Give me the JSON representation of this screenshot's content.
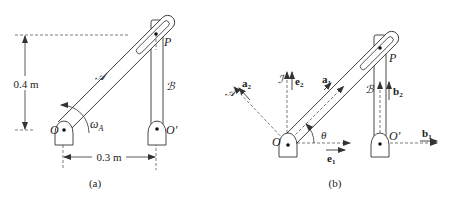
{
  "figure_a": {
    "caption": "(a)",
    "labels": {
      "height_dim": "0.4 m",
      "width_dim": "0.3 m",
      "pivot_o": "O",
      "pivot_o_prime": "O′",
      "point_p": "P",
      "arm_a": "𝒜",
      "bar_b": "ℬ",
      "omega": "ω",
      "omega_sub": "A"
    }
  },
  "figure_b": {
    "caption": "(b)",
    "labels": {
      "pivot_o": "O",
      "pivot_o_prime": "O′",
      "point_p": "P",
      "frame_i": "ℐ",
      "frame_a": "𝒜",
      "frame_b": "ℬ",
      "angle": "θ",
      "e1": "e",
      "e1_sub": "1",
      "e2": "e",
      "e2_sub": "2",
      "a1": "a",
      "a1_sub": "1",
      "a2": "a",
      "a2_sub": "2",
      "b1": "b",
      "b1_sub": "1",
      "b2": "b",
      "b2_sub": "2"
    }
  },
  "colors": {
    "stroke": "#333333",
    "background": "#ffffff"
  }
}
